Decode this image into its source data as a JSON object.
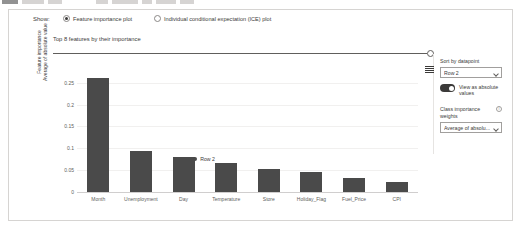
{
  "show": {
    "label": "Show:",
    "options": [
      {
        "label": "Feature importance plot",
        "selected": true
      },
      {
        "label": "Individual conditional expectation (ICE) plot",
        "selected": false
      }
    ]
  },
  "chart_header": {
    "title": "Top 8 features by their importance",
    "slider_name": "top-k-features-slider",
    "slider_position": "max"
  },
  "panel": {
    "sort_label": "Sort by datapoint",
    "sort_value": "Row 2",
    "toggle_label": "View as absolute values",
    "toggle_on": true,
    "class_weights_label": "Class importance weights",
    "class_weights_value": "Average of absolu...",
    "info_glyph": "i",
    "menu_icon": "hamburger-menu-icon"
  },
  "chart_data": {
    "type": "bar",
    "title": "Top 8 features by their importance",
    "xlabel": "",
    "ylabel": "Feature importance Average of absolute value",
    "ylabel_lines": [
      "Feature importance",
      "Average of absolute value"
    ],
    "categories": [
      "Month",
      "Unemployment",
      "Day",
      "Temperature",
      "Store",
      "Holiday_Flag",
      "Fuel_Price",
      "CPI"
    ],
    "values": [
      0.262,
      0.093,
      0.079,
      0.067,
      0.052,
      0.046,
      0.032,
      0.022
    ],
    "ylim": [
      0,
      0.27
    ],
    "yticks": [
      0,
      0.05,
      0.1,
      0.15,
      0.2,
      0.25
    ],
    "ytick_labels": [
      "0",
      "0.05",
      "0.1",
      "0.15",
      "0.2",
      "0.25"
    ],
    "grid": true,
    "legend_position": "bottom",
    "series": [
      {
        "name": "Row 2",
        "color": "#4a4a4a",
        "values": [
          0.262,
          0.093,
          0.079,
          0.067,
          0.052,
          0.046,
          0.032,
          0.022
        ]
      }
    ],
    "bar_color": "#4a4a4a"
  },
  "legend": {
    "entries": [
      {
        "label": "Row 2",
        "color": "#4a4a4a"
      }
    ]
  }
}
